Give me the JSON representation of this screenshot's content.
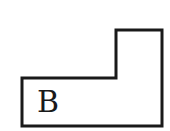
{
  "diagram": {
    "shape": "L-shaped polygon",
    "label": "B",
    "stroke_color": "#1a1a1a",
    "fill_color": "#ffffff",
    "points": "22,78 116,78 116,30 162,30 162,126 22,126"
  }
}
